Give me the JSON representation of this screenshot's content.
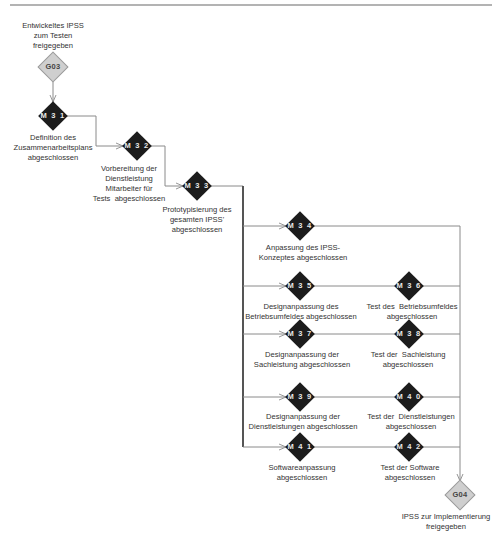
{
  "diagram": {
    "type": "milestone-flow",
    "colors": {
      "milestone_fill": "#1c1c1c",
      "gate_fill": "#cfcfcf",
      "line": "#8a8a8a",
      "bus_line": "#555555",
      "text": "#333333"
    },
    "gates": [
      {
        "id": "G03",
        "label": "Entwickeltes IPSS\nzum Testen\nfreigegeben"
      },
      {
        "id": "G04",
        "label": "IPSS zur Implementierung\nfreigegeben"
      }
    ],
    "milestones": [
      {
        "id": "M 3 1",
        "label": "Definition des\nZusammenarbeitsplans\nabgeschlossen"
      },
      {
        "id": "M 3 2",
        "label": "Vorbereitung der\nDienstleistung\nMitarbeiter für\nTests  abgeschlossen"
      },
      {
        "id": "M 3 3",
        "label": "Prototypisierung des\ngesamten IPSS'\nabgeschlossen"
      },
      {
        "id": "M 3 4",
        "label": "Anpassung des IPSS-\nKonzeptes abgeschlossen"
      },
      {
        "id": "M 3 5",
        "label": "Designanpassung des\nBetriebsumfeldes abgeschlossen"
      },
      {
        "id": "M 3 6",
        "label": "Test des  Betriebsumfeldes\nabgeschlossen"
      },
      {
        "id": "M 3 7",
        "label": "Designanpassung der\nSachleistung abgeschlossen"
      },
      {
        "id": "M 3 8",
        "label": "Test der  Sachleistung\nabgeschlossen"
      },
      {
        "id": "M 3 9",
        "label": "Designanpassung der\nDienstleistungen abgeschlossen"
      },
      {
        "id": "M 4 0",
        "label": "Test der  Dienstleistungen\nabgeschlossen"
      },
      {
        "id": "M 4 1",
        "label": "Softwareanpassung\nabgeschlossen"
      },
      {
        "id": "M 4 2",
        "label": "Test der Software\nabgeschlossen"
      }
    ]
  }
}
